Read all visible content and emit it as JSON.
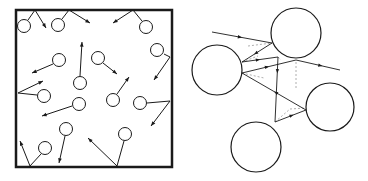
{
  "figure": {
    "panels": [
      {
        "id": "gas-container",
        "description": "Gas molecules moving randomly inside a closed container, colliding with walls",
        "box": {
          "x": 16,
          "y": 10,
          "w": 156,
          "h": 157
        },
        "colors": {
          "stroke": "#1a1a1a",
          "fill": "#ffffff"
        },
        "molecules": [
          {
            "cx": 24,
            "cy": 26,
            "r": 6.5,
            "path": [
              [
                28,
                20
              ],
              [
                35,
                10
              ],
              [
                46,
                28
              ]
            ]
          },
          {
            "cx": 58,
            "cy": 25,
            "r": 6.5,
            "path": [
              [
                62,
                19
              ],
              [
                69,
                10
              ],
              [
                90,
                23
              ]
            ]
          },
          {
            "cx": 146,
            "cy": 27,
            "r": 6.5,
            "path": [
              [
                142,
                21
              ],
              [
                133,
                10
              ],
              [
                113,
                23
              ]
            ]
          },
          {
            "cx": 157,
            "cy": 50,
            "r": 6.5,
            "path": [
              [
                164,
                54
              ],
              [
                170,
                57
              ],
              [
                154,
                80
              ]
            ]
          },
          {
            "cx": 59,
            "cy": 60,
            "r": 6.5,
            "path": [
              [
                53,
                64
              ],
              [
                32,
                73
              ]
            ]
          },
          {
            "cx": 80,
            "cy": 83,
            "r": 6.5,
            "path": [
              [
                80,
                76
              ],
              [
                82,
                42
              ]
            ]
          },
          {
            "cx": 98,
            "cy": 58,
            "r": 6.5,
            "path": [
              [
                103,
                63
              ],
              [
                117,
                74
              ]
            ]
          },
          {
            "cx": 44,
            "cy": 96,
            "r": 6.5,
            "path": [
              [
                37,
                95
              ],
              [
                18,
                93
              ],
              [
                43,
                81
              ]
            ]
          },
          {
            "cx": 79,
            "cy": 104,
            "r": 6.5,
            "path": [
              [
                72,
                106
              ],
              [
                42,
                116
              ]
            ]
          },
          {
            "cx": 113,
            "cy": 100,
            "r": 6.5,
            "path": [
              [
                117,
                94
              ],
              [
                129,
                77
              ]
            ]
          },
          {
            "cx": 140,
            "cy": 103,
            "r": 6.5,
            "path": [
              [
                147,
                103
              ],
              [
                170,
                101
              ],
              [
                151,
                126
              ]
            ]
          },
          {
            "cx": 66,
            "cy": 129,
            "r": 6.5,
            "path": [
              [
                65,
                136
              ],
              [
                59,
                163
              ]
            ]
          },
          {
            "cx": 125,
            "cy": 134,
            "r": 6.5,
            "path": [
              [
                124,
                141
              ],
              [
                117,
                166
              ],
              [
                88,
                138
              ]
            ]
          },
          {
            "cx": 45,
            "cy": 148,
            "r": 6.5,
            "path": [
              [
                41,
                154
              ],
              [
                30,
                166
              ],
              [
                20,
                141
              ]
            ]
          }
        ]
      },
      {
        "id": "molecule-scattering",
        "description": "Path of a molecule colliding between several molecules (mean free path)",
        "colors": {
          "stroke": "#1a1a1a",
          "dashed": "#9a9a9a"
        },
        "circles": [
          {
            "name": "top-molecule",
            "cx": 112,
            "cy": 33,
            "r": 25
          },
          {
            "name": "left-molecule",
            "cx": 33,
            "cy": 70,
            "r": 25
          },
          {
            "name": "right-molecule",
            "cx": 146,
            "cy": 107,
            "r": 24
          },
          {
            "name": "bottom-molecule",
            "cx": 72,
            "cy": 147,
            "r": 25
          }
        ],
        "path_segments": [
          {
            "from": [
              28,
              32
            ],
            "to": [
              88,
              43
            ],
            "arrow_at": 0.5
          },
          {
            "from": [
              88,
              43
            ],
            "to": [
              58,
              62
            ],
            "arrow_at": 0.6
          },
          {
            "from": [
              58,
              62
            ],
            "to": [
              94,
              57
            ],
            "arrow_at": 0.5
          },
          {
            "from": [
              94,
              57
            ],
            "to": [
              91,
              122
            ],
            "arrow_at": 0.0
          },
          {
            "from": [
              91,
              122
            ],
            "to": [
              122,
              110
            ],
            "arrow_at": 0.6
          },
          {
            "from": [
              122,
              110
            ],
            "to": [
              58,
              73
            ],
            "arrow_at": 0.5
          },
          {
            "from": [
              58,
              73
            ],
            "to": [
              112,
              60
            ],
            "arrow_at": 0.5
          },
          {
            "from": [
              112,
              60
            ],
            "to": [
              156,
              70
            ],
            "arrow_at": 0.6
          }
        ],
        "dashed_lines": [
          {
            "from": [
              64,
              46
            ],
            "to": [
              88,
              43
            ]
          },
          {
            "from": [
              58,
              62
            ],
            "to": [
              74,
              56
            ]
          },
          {
            "from": [
              58,
              73
            ],
            "to": [
              80,
              78
            ]
          },
          {
            "from": [
              112,
              62
            ],
            "to": [
              112,
              90
            ]
          },
          {
            "from": [
              94,
              57
            ],
            "to": [
              97,
              60
            ]
          },
          {
            "from": [
              91,
              122
            ],
            "to": [
              106,
              109
            ]
          },
          {
            "from": [
              106,
              109
            ],
            "to": [
              122,
              108
            ]
          }
        ]
      }
    ]
  }
}
